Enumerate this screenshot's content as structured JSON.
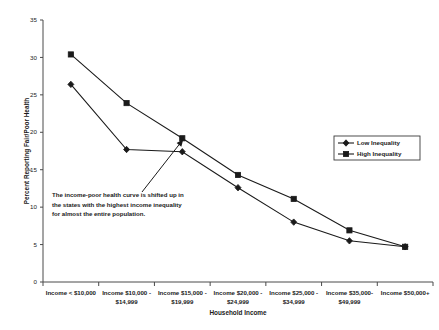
{
  "chart_data": {
    "type": "line",
    "title": "",
    "xlabel": "Household Income",
    "ylabel": "Percent Reporting  Fair/Poor Health",
    "ylim": [
      0,
      35
    ],
    "ytick_values": [
      0,
      5,
      10,
      15,
      20,
      25,
      30,
      35
    ],
    "ytick_labels": [
      "0",
      "5",
      "10",
      "15",
      "20",
      "25",
      "30",
      "35"
    ],
    "grid": false,
    "legend_position": "right",
    "categories": [
      "Income < $10,000",
      "Income $10,000 - $14,999",
      "Income $15,000 - $19,999",
      "Income $20,000 - $24,999",
      "Income $25,000 - $34,999",
      "Income $35,000-$49,999",
      "Income $50,000+"
    ],
    "category_lines": [
      [
        "Income < $10,000",
        ""
      ],
      [
        "Income $10,000 -",
        "$14,999"
      ],
      [
        "Income $15,000 -",
        "$19,999"
      ],
      [
        "Income $20,000 -",
        "$24,999"
      ],
      [
        "Income $25,000 -",
        "$34,999"
      ],
      [
        "Income $35,000-",
        "$49,999"
      ],
      [
        "Income $50,000+",
        ""
      ]
    ],
    "series": [
      {
        "name": "Low Inequality",
        "marker": "diamond",
        "values": [
          26.4,
          17.7,
          17.4,
          12.6,
          8.0,
          5.5,
          4.7
        ]
      },
      {
        "name": "High Inequality",
        "marker": "square",
        "values": [
          30.4,
          23.9,
          19.2,
          14.3,
          11.1,
          6.9,
          4.7
        ]
      }
    ],
    "annotations": [
      {
        "name": "income-poor-curve-note",
        "lines": [
          "The  income-poor health curve is shifted up in",
          "the states with the highest income inequality",
          "for almost the entire population."
        ],
        "arrow_from_category_index": 2,
        "arrow_to_value": 19.2
      }
    ]
  },
  "legend": {
    "entries": [
      {
        "label": "Low Inequality",
        "marker": "diamond"
      },
      {
        "label": "High Inequality",
        "marker": "square"
      }
    ]
  }
}
